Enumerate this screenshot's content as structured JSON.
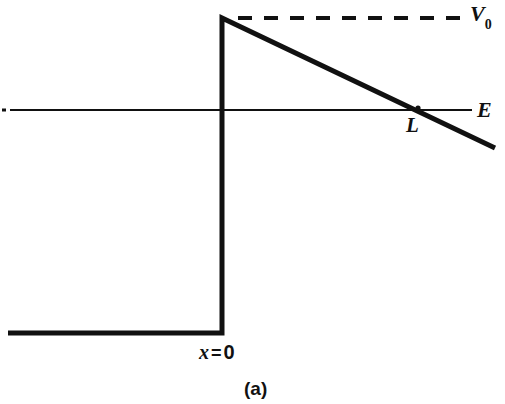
{
  "figure": {
    "caption": "(a)",
    "labels": {
      "v0_symbol": "V",
      "v0_subscript": "0",
      "energy_symbol": "E",
      "turning_point": "L",
      "origin_var": "x",
      "origin_eq": "=",
      "origin_val": "0"
    },
    "colors": {
      "ink": "#111111",
      "background": "#ffffff"
    }
  },
  "chart_data": {
    "type": "line",
    "title": "",
    "subtitle": "",
    "xlabel": "x",
    "ylabel": "V(x)",
    "grid": false,
    "legend_position": "right-inline",
    "axis_ranges": {
      "x_pixel": [
        0,
        505
      ],
      "y_pixel": [
        0,
        404
      ]
    },
    "annotations": [
      {
        "text": "V",
        "sub": "0",
        "x": 470,
        "y": 14,
        "style": "italic-serif-bold"
      },
      {
        "text": "E",
        "x": 477,
        "y": 110,
        "style": "italic-serif-bold"
      },
      {
        "text": "L",
        "x": 406,
        "y": 126,
        "style": "italic-serif-bold"
      },
      {
        "text": "x = 0",
        "x": 199,
        "y": 353,
        "style": "bold-mixed"
      },
      {
        "text": "(a)",
        "x": 244,
        "y": 391,
        "style": "bold-sans"
      }
    ],
    "series": [
      {
        "name": "potential-barrier",
        "role": "potential energy V(x), thick solid",
        "stroke": "#111111",
        "width_px": 5,
        "points": [
          [
            8,
            333
          ],
          [
            222,
            333
          ],
          [
            222,
            18
          ],
          [
            495,
            148
          ]
        ]
      },
      {
        "name": "v0-level",
        "role": "barrier top reference level, dashed",
        "stroke": "#111111",
        "width_px": 4,
        "dash": "14 12",
        "points": [
          [
            238,
            18
          ],
          [
            462,
            18
          ]
        ]
      },
      {
        "name": "energy-level",
        "role": "particle total energy E, thin solid",
        "stroke": "#111111",
        "width_px": 2,
        "points": [
          [
            10,
            110
          ],
          [
            472,
            110
          ]
        ]
      },
      {
        "name": "left-tick",
        "role": "small tick mark at left end of E line",
        "stroke": "#111111",
        "points": [
          [
            2,
            110
          ],
          [
            6,
            110
          ]
        ]
      }
    ],
    "markers": [
      {
        "name": "turning-point-L",
        "x": 418,
        "y": 108,
        "label": "L"
      }
    ]
  }
}
